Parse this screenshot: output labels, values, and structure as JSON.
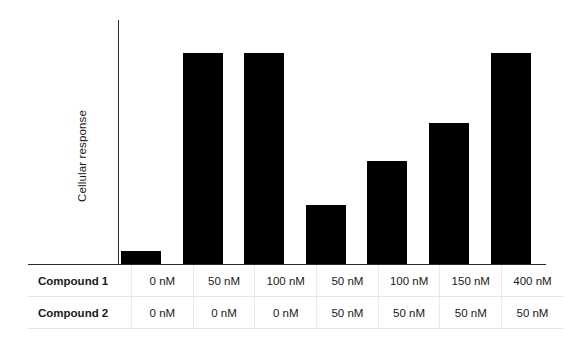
{
  "chart_data": {
    "type": "bar",
    "title": "",
    "subtitle": "",
    "xlabel": "",
    "ylabel": "Cellular response",
    "ylim": [
      0,
      100
    ],
    "grid": false,
    "legend": null,
    "annotations": [],
    "tick_labels_y": [],
    "bar_color": "#000000",
    "axis_color": "#2b2b2b",
    "categories": [
      "0 nM / 0 nM",
      "50 nM / 0 nM",
      "100 nM / 0 nM",
      "50 nM / 50 nM",
      "100 nM / 50 nM",
      "150 nM / 50 nM",
      "400 nM / 50 nM"
    ],
    "values": [
      6,
      100,
      100,
      28,
      49,
      67,
      100
    ]
  },
  "table": {
    "rows": [
      {
        "header": "Compound 1",
        "values": [
          "0 nM",
          "50 nM",
          "100 nM",
          "50 nM",
          "100 nM",
          "150 nM",
          "400 nM"
        ]
      },
      {
        "header": "Compound 2",
        "values": [
          "0 nM",
          "0 nM",
          "0 nM",
          "50 nM",
          "50 nM",
          "50 nM",
          "50 nM"
        ]
      }
    ]
  }
}
